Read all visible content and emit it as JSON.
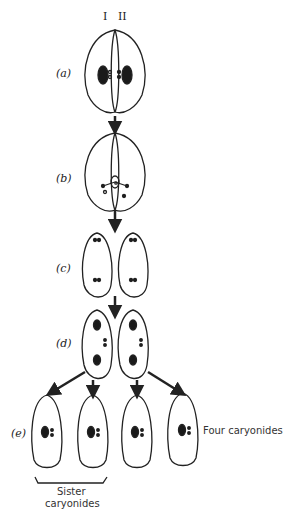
{
  "figure": {
    "column_labels": [
      "I",
      "II"
    ],
    "stages": [
      {
        "id": "a",
        "label": "(a)"
      },
      {
        "id": "b",
        "label": "(b)"
      },
      {
        "id": "c",
        "label": "(c)"
      },
      {
        "id": "d",
        "label": "(d)"
      },
      {
        "id": "e",
        "label": "(e)"
      }
    ],
    "annotations": {
      "four_caryonides": "Four caryonides",
      "sister_line1": "Sister",
      "sister_line2": "caryonides"
    },
    "colors": {
      "stroke": "#222222",
      "fill_nucleus": "#1a1a1a",
      "background": "#ffffff"
    }
  }
}
